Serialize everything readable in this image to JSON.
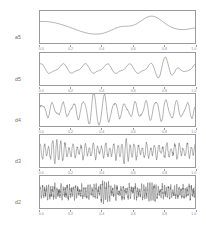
{
  "figure": {
    "title": "",
    "background_color": "#ffffff",
    "line_color": "#555555",
    "frame_color": "#9a9a9a",
    "label_color": "#6e6e6e",
    "tick_color": "#8a8a8a"
  },
  "axis": {
    "tick_labels": [
      "0.0",
      "0.2",
      "0.4",
      "0.6",
      "0.8",
      "1.0"
    ],
    "tick_values": [
      0.0,
      0.2,
      0.4,
      0.6,
      0.8,
      1.0
    ],
    "xlim": [
      0.0,
      1.0
    ]
  },
  "panels": [
    {
      "label": "a5",
      "index": 0
    },
    {
      "label": "d5",
      "index": 1
    },
    {
      "label": "d4",
      "index": 2
    },
    {
      "label": "d3",
      "index": 3
    },
    {
      "label": "d2",
      "index": 4
    }
  ],
  "chart_data": {
    "type": "line",
    "title": "",
    "xlabel": "",
    "ylabel": "",
    "xlim": [
      0.0,
      1.0
    ],
    "grid": false,
    "legend": "none",
    "x_tick_labels": [
      "0.0",
      "0.2",
      "0.4",
      "0.6",
      "0.8",
      "1.0"
    ],
    "n_points": 200,
    "series": [
      {
        "name": "a5",
        "panel": 0,
        "ylim": [
          -1.15,
          1.15
        ],
        "description": "smooth low-frequency approximation; starts near 0.42, declines to a minimum near x=0.36, small bump near x=0.52, large peak near x=0.72, decays to near zero at x=1.0",
        "components": [
          {
            "kind": "gauss",
            "amp": 1.0,
            "center": 0.72,
            "width": 0.072
          },
          {
            "kind": "gauss",
            "amp": 0.3,
            "center": 0.52,
            "width": 0.055
          },
          {
            "kind": "gauss",
            "amp": 0.62,
            "center": 0.02,
            "width": 0.14
          },
          {
            "kind": "gauss",
            "amp": -0.33,
            "center": 0.35,
            "width": 0.1
          },
          {
            "kind": "gauss",
            "amp": 0.14,
            "center": 1.0,
            "width": 0.035
          }
        ],
        "noise_amp": 0.0,
        "baseline": -0.22
      },
      {
        "name": "d5",
        "panel": 1,
        "ylim": [
          -1.15,
          1.15
        ],
        "description": "oscillating detail, about 7 cycles across the window, amplitude modest until a very large excursion near x=0.80 then a deep trough near x=0.86",
        "components": [
          {
            "kind": "sine",
            "amp": 0.3,
            "freq": 7.0,
            "phase": 1.5
          },
          {
            "kind": "sine",
            "amp": 0.1,
            "freq": 14.0,
            "phase": 0.4
          },
          {
            "kind": "gauss_sine",
            "amp": 1.0,
            "center": 0.82,
            "width": 0.052,
            "freq": 9.0,
            "phase": 0.0
          }
        ],
        "noise_amp": 0.02,
        "baseline": 0.0
      },
      {
        "name": "d4",
        "panel": 2,
        "ylim": [
          -1.15,
          1.15
        ],
        "description": "higher-frequency detail, roughly 15 oscillations, strongest amplitude burst near x=0.33-0.42",
        "components": [
          {
            "kind": "sine",
            "amp": 0.42,
            "freq": 15.0,
            "phase": 0.2
          },
          {
            "kind": "sine",
            "amp": 0.16,
            "freq": 26.0,
            "phase": 2.1
          },
          {
            "kind": "gauss_sine",
            "amp": 0.8,
            "center": 0.37,
            "width": 0.06,
            "freq": 15.0,
            "phase": 0.2
          },
          {
            "kind": "gauss_sine",
            "amp": 0.3,
            "center": 0.78,
            "width": 0.09,
            "freq": 15.0,
            "phase": 0.2
          }
        ],
        "noise_amp": 0.05,
        "baseline": 0.0
      },
      {
        "name": "d3",
        "panel": 3,
        "ylim": [
          -1.15,
          1.15
        ],
        "description": "dense detail, roughly 38 oscillations, fairly uniform amplitude with taller spikes near x=0.11 and x=0.55",
        "components": [
          {
            "kind": "sine",
            "amp": 0.4,
            "freq": 38.0,
            "phase": 0.9
          },
          {
            "kind": "sine",
            "amp": 0.18,
            "freq": 23.0,
            "phase": 2.6
          },
          {
            "kind": "gauss_sine",
            "amp": 0.45,
            "center": 0.11,
            "width": 0.025,
            "freq": 38.0,
            "phase": 0.9
          },
          {
            "kind": "gauss_sine",
            "amp": 0.35,
            "center": 0.55,
            "width": 0.03,
            "freq": 38.0,
            "phase": 0.9
          }
        ],
        "noise_amp": 0.12,
        "baseline": 0.0
      },
      {
        "name": "d2",
        "panel": 4,
        "ylim": [
          -1.15,
          1.15
        ],
        "description": "highest-frequency noise-like detail, roughly 75 oscillations, near-uniform amplitude across the window with occasional larger spikes",
        "components": [
          {
            "kind": "sine",
            "amp": 0.34,
            "freq": 75.0,
            "phase": 0.3
          },
          {
            "kind": "sine",
            "amp": 0.16,
            "freq": 52.0,
            "phase": 1.8
          },
          {
            "kind": "gauss_sine",
            "amp": 0.3,
            "center": 0.42,
            "width": 0.02,
            "freq": 75.0,
            "phase": 0.3
          },
          {
            "kind": "gauss_sine",
            "amp": 0.28,
            "center": 0.72,
            "width": 0.022,
            "freq": 75.0,
            "phase": 0.3
          }
        ],
        "noise_amp": 0.2,
        "baseline": 0.0
      }
    ]
  }
}
